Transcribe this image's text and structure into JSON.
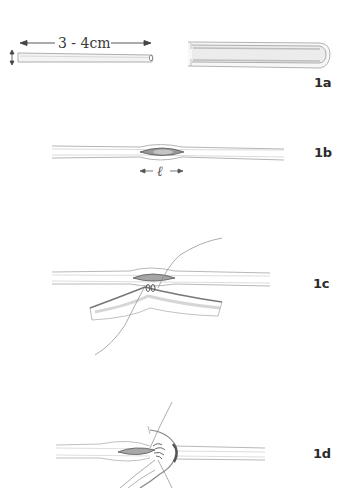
{
  "figure": {
    "panels": [
      {
        "id": "1a",
        "label": "1a",
        "annotations": {
          "length": "3 - 4cm",
          "diameter_arrow": "↕"
        },
        "description": "Vein segment 3-4 cm long (left) and opened longitudinally (right)"
      },
      {
        "id": "1b",
        "label": "1b",
        "annotations": {
          "incision_length": "ℓ"
        },
        "description": "Vessel with longitudinal arteriotomy of length l"
      },
      {
        "id": "1c",
        "label": "1c",
        "annotations": {},
        "description": "Patch/graft being sutured to the arteriotomy at the heel"
      },
      {
        "id": "1d",
        "label": "1d",
        "annotations": {},
        "description": "Continuing suture of the graft around the arteriotomy"
      }
    ],
    "colors": {
      "line": "#8a8a8a",
      "shade": "#bdbdbd",
      "lumen": "#7d7d7d",
      "label": "#2b2b2b"
    }
  }
}
